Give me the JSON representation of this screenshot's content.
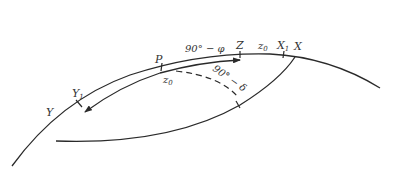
{
  "diagram": {
    "type": "spherical-astronomy",
    "colors": {
      "line": "#2a2a2a",
      "text": "#333333",
      "background": "#ffffff"
    },
    "points": {
      "P": "P",
      "Z": "Z",
      "X": "X",
      "X1_base": "X",
      "X1_sub": "1",
      "Y": "Y",
      "Y1_base": "Y",
      "Y1_sub": "1"
    },
    "arc_labels": {
      "colatitude": "90° − φ",
      "z0_top": "z",
      "z0_top_sub": "0",
      "z0_bottom": "z",
      "z0_bottom_sub": "0",
      "codeclination": "90° − δ"
    }
  }
}
